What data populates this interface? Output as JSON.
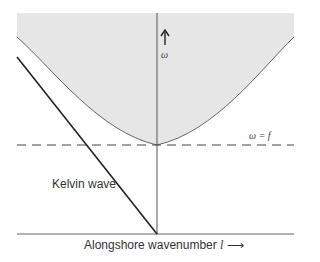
{
  "diagram": {
    "type": "dispersion-diagram",
    "labels": {
      "kelvin_wave": "Kelvin wave",
      "x_axis_text": "Alongshore wavenumber",
      "x_axis_symbol": "l",
      "x_axis_arrow": "⟶",
      "y_axis_arrow": "↑",
      "y_axis_symbol": "ω",
      "inertial_line": "ω = f"
    },
    "elements": [
      {
        "name": "shaded-region",
        "description": "Poincaré wave continuum above hyperbola ω² = f² + c²l²",
        "color": "#e6e6e6"
      },
      {
        "name": "hyperbola",
        "min_at": "l = 0, ω = f"
      },
      {
        "name": "dashed-line",
        "label": "ω = f"
      },
      {
        "name": "kelvin-line",
        "description": "straight line through origin, negative l"
      },
      {
        "name": "vertical-axis",
        "label": "ω"
      },
      {
        "name": "horizontal-axis",
        "label": "Alongshore wavenumber l"
      }
    ],
    "colors": {
      "shade": "#e6e6e6",
      "axis": "#555555",
      "kelvin": "#222222"
    }
  }
}
